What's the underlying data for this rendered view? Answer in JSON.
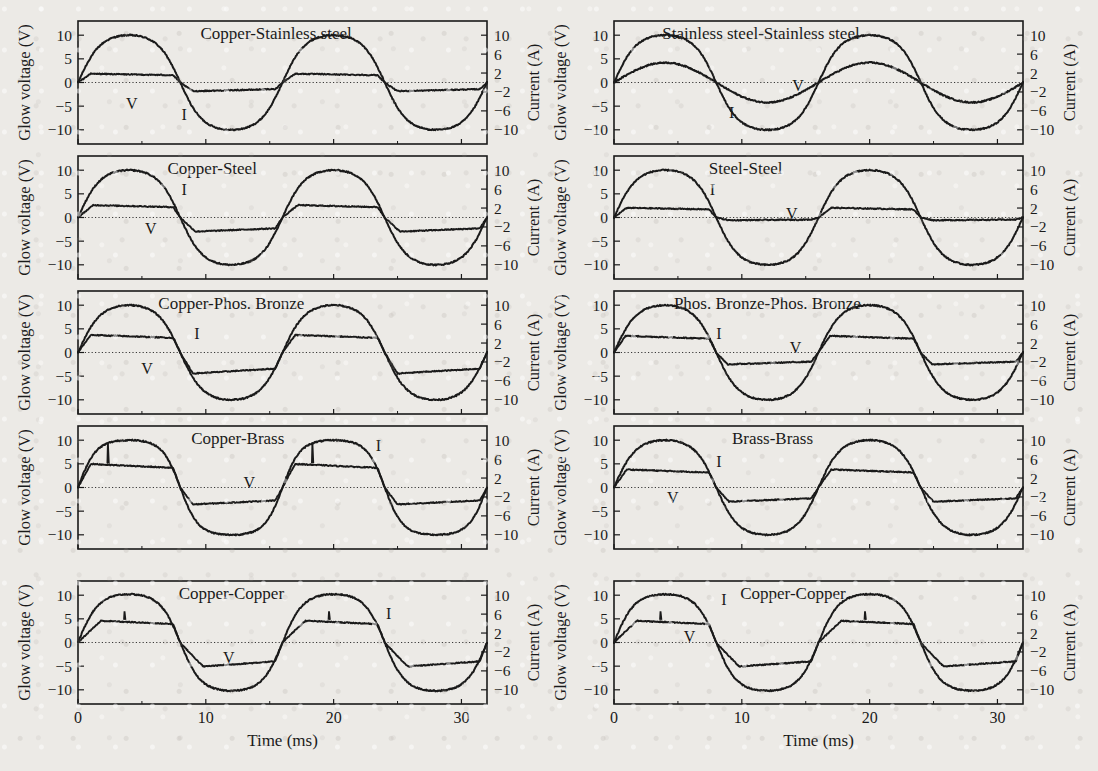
{
  "figure": {
    "background_color": "#eceae6",
    "ink_color": "#1a1a1a",
    "rows": 5,
    "columns": 2,
    "left_axis_title": "Glow voltage (V)",
    "right_axis_title": "Current (A)",
    "x_axis_title": "Time (ms)",
    "x_ticks": [
      "0",
      "10",
      "20",
      "30"
    ],
    "left_y_ticks": [
      "10",
      "5",
      "0",
      "−5",
      "−10"
    ],
    "right_y_ticks": [
      "10",
      "6",
      "2",
      "−2",
      "−6",
      "−10"
    ],
    "series_labels": {
      "voltage": "V",
      "current": "I"
    }
  },
  "chart_data": {
    "type": "line",
    "title": "",
    "xlabel": "Time (ms)",
    "ylabel": "Glow voltage (V)",
    "ylabel_right": "Current (A)",
    "xlim": [
      0,
      32
    ],
    "ylim": [
      -13,
      13
    ],
    "ylim_right": [
      -13,
      13
    ],
    "xticks": [
      0,
      10,
      20,
      30
    ],
    "yticks_left": [
      10,
      5,
      0,
      -5,
      -10
    ],
    "yticks_right": [
      10,
      6,
      2,
      -2,
      -6,
      -10
    ],
    "grid": false,
    "legend": "inline-annotations",
    "frequency_hz": 62.5,
    "period_ms": 16,
    "panels": [
      {
        "index": 0,
        "row": 0,
        "col": 0,
        "title": "Copper-Stainless steel",
        "title_x_ms": 15.5,
        "series": [
          {
            "name": "I",
            "label": "I",
            "label_x_ms": 8.3,
            "label_y": -6.6,
            "kind": "sine",
            "amplitude": 10.0,
            "phase_ms": 0.0,
            "flat_top": 0.05
          },
          {
            "name": "V",
            "label": "V",
            "label_x_ms": 4.2,
            "label_y": -4.4,
            "kind": "clipped",
            "pos_level": 1.9,
            "neg_level": -1.9,
            "rise_ms": 1.0
          }
        ]
      },
      {
        "index": 1,
        "row": 0,
        "col": 1,
        "title": "Stainless steel-Stainless steel",
        "title_x_ms": 11.5,
        "series": [
          {
            "name": "I",
            "label": "I",
            "label_x_ms": 9.2,
            "label_y": -6.3,
            "kind": "sine",
            "amplitude": 10.0,
            "phase_ms": 0.0,
            "flat_top": 0.05
          },
          {
            "name": "V",
            "label": "V",
            "label_x_ms": 14.4,
            "label_y": -0.6,
            "kind": "sine",
            "amplitude": 4.2,
            "phase_ms": 0.0,
            "flat_top": 0.0
          }
        ]
      },
      {
        "index": 2,
        "row": 1,
        "col": 0,
        "title": "Copper-Steel",
        "title_x_ms": 10.5,
        "series": [
          {
            "name": "I",
            "label": "I",
            "label_x_ms": 8.3,
            "label_y": 6.1,
            "kind": "sine",
            "amplitude": 10.0,
            "phase_ms": 0.0,
            "flat_top": 0.05
          },
          {
            "name": "V",
            "label": "V",
            "label_x_ms": 5.7,
            "label_y": -2.2,
            "kind": "clipped",
            "pos_level": 2.7,
            "neg_level": -3.1,
            "rise_ms": 1.2
          }
        ]
      },
      {
        "index": 3,
        "row": 1,
        "col": 1,
        "title": "Steel-Steel",
        "title_x_ms": 10.3,
        "series": [
          {
            "name": "I",
            "label": "I",
            "label_x_ms": 7.7,
            "label_y": 6.0,
            "kind": "sine",
            "amplitude": 10.0,
            "phase_ms": 0.0,
            "flat_top": 0.05
          },
          {
            "name": "V",
            "label": "V",
            "label_x_ms": 13.9,
            "label_y": 1.0,
            "kind": "clipped",
            "pos_level": 2.1,
            "neg_level": -0.6,
            "rise_ms": 1.0
          }
        ]
      },
      {
        "index": 4,
        "row": 2,
        "col": 0,
        "title": "Copper-Phos. Bronze",
        "title_x_ms": 12.0,
        "series": [
          {
            "name": "I",
            "label": "I",
            "label_x_ms": 9.3,
            "label_y": 4.2,
            "kind": "sine",
            "amplitude": 10.0,
            "phase_ms": 0.0,
            "flat_top": 0.05
          },
          {
            "name": "V",
            "label": "V",
            "label_x_ms": 5.4,
            "label_y": -3.2,
            "kind": "clipped",
            "pos_level": 3.8,
            "neg_level": -4.6,
            "rise_ms": 1.0
          }
        ]
      },
      {
        "index": 5,
        "row": 2,
        "col": 1,
        "title": "Phos. Bronze-Phos. Bronze",
        "title_x_ms": 12.0,
        "series": [
          {
            "name": "I",
            "label": "I",
            "label_x_ms": 8.2,
            "label_y": 4.2,
            "kind": "sine",
            "amplitude": 10.0,
            "phase_ms": 0.0,
            "flat_top": 0.05
          },
          {
            "name": "V",
            "label": "V",
            "label_x_ms": 14.2,
            "label_y": 1.1,
            "kind": "clipped",
            "pos_level": 3.6,
            "neg_level": -2.6,
            "rise_ms": 0.9
          }
        ]
      },
      {
        "index": 6,
        "row": 3,
        "col": 0,
        "title": "Copper-Brass",
        "title_x_ms": 12.5,
        "series": [
          {
            "name": "I",
            "label": "I",
            "label_x_ms": 23.5,
            "label_y": 9.0,
            "kind": "sine",
            "amplitude": 10.0,
            "phase_ms": 0.0,
            "flat_top": 0.12
          },
          {
            "name": "V",
            "label": "V",
            "label_x_ms": 13.4,
            "label_y": 1.2,
            "kind": "clipped",
            "pos_level": 5.1,
            "neg_level": -3.7,
            "rise_ms": 1.0,
            "spike_x_ms": 2.3,
            "spike_y": 9.5
          }
        ]
      },
      {
        "index": 7,
        "row": 3,
        "col": 1,
        "title": "Brass-Brass",
        "title_x_ms": 12.4,
        "series": [
          {
            "name": "I",
            "label": "I",
            "label_x_ms": 8.2,
            "label_y": 5.6,
            "kind": "sine",
            "amplitude": 10.0,
            "phase_ms": 0.0,
            "flat_top": 0.06
          },
          {
            "name": "V",
            "label": "V",
            "label_x_ms": 4.6,
            "label_y": -2.0,
            "kind": "clipped",
            "pos_level": 3.9,
            "neg_level": -3.1,
            "rise_ms": 1.0
          }
        ]
      },
      {
        "index": 8,
        "row": 4,
        "col": 0,
        "title": "Copper-Copper",
        "title_x_ms": 12.0,
        "series": [
          {
            "name": "I",
            "label": "I",
            "label_x_ms": 24.3,
            "label_y": 6.3,
            "kind": "sine",
            "amplitude": 10.2,
            "phase_ms": 0.0,
            "flat_top": 0.08
          },
          {
            "name": "V",
            "label": "V",
            "label_x_ms": 11.8,
            "label_y": -3.1,
            "kind": "clipped",
            "pos_level": 4.8,
            "neg_level": -5.4,
            "rise_ms": 1.8,
            "spike_x_ms": 3.6,
            "spike_y": 6.6
          }
        ]
      },
      {
        "index": 9,
        "row": 4,
        "col": 1,
        "title": "Copper-Copper",
        "title_x_ms": 14.0,
        "series": [
          {
            "name": "I",
            "label": "I",
            "label_x_ms": 8.6,
            "label_y": 9.2,
            "kind": "sine",
            "amplitude": 10.2,
            "phase_ms": 0.0,
            "flat_top": 0.08
          },
          {
            "name": "V",
            "label": "V",
            "label_x_ms": 5.9,
            "label_y": 1.4,
            "kind": "clipped",
            "pos_level": 4.8,
            "neg_level": -5.4,
            "rise_ms": 1.8,
            "spike_x_ms": 3.6,
            "spike_y": 6.6
          }
        ]
      }
    ]
  }
}
